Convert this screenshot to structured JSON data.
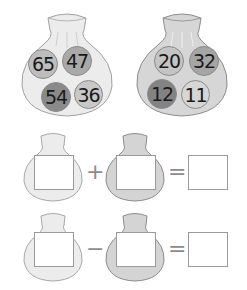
{
  "bags": [
    {
      "name": "bag-left",
      "balls": [
        {
          "value": "65",
          "shade": "#bdbdbd"
        },
        {
          "value": "47",
          "shade": "#a9a9a9"
        },
        {
          "value": "54",
          "shade": "#8a8a8a"
        },
        {
          "value": "36",
          "shade": "#c8c8c8"
        }
      ]
    },
    {
      "name": "bag-right",
      "balls": [
        {
          "value": "20",
          "shade": "#c4c4c4"
        },
        {
          "value": "32",
          "shade": "#a5a5a5"
        },
        {
          "value": "12",
          "shade": "#838383"
        },
        {
          "value": "11",
          "shade": "#d6d6d6"
        }
      ]
    }
  ],
  "equations": [
    {
      "operator": "+",
      "equals": "="
    },
    {
      "operator": "−",
      "equals": "="
    }
  ],
  "colors": {
    "bag_light_fill": "#ececec",
    "bag_dark_fill": "#d4d4d4",
    "bag_outline": "#9a9a9a",
    "box_border": "#9a9a9a"
  }
}
